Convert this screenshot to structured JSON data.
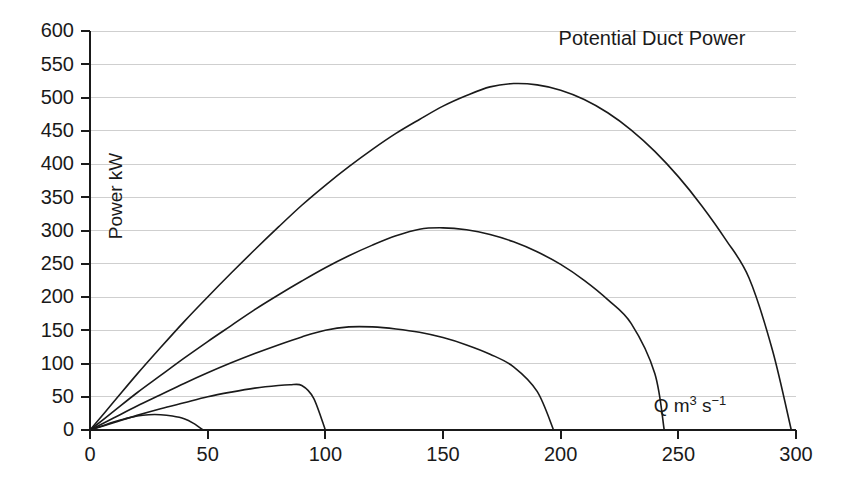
{
  "chart_data": {
    "type": "line",
    "title": "Potential Duct Power",
    "xlabel": "Q m3 s-1",
    "xlabel_parts": {
      "base1": "Q m",
      "sup1": "3",
      "base2": " s",
      "sup2": "−1"
    },
    "ylabel": "Power kW",
    "xlim": [
      0,
      300
    ],
    "ylim": [
      0,
      600
    ],
    "xticks": [
      0,
      50,
      100,
      150,
      200,
      250,
      300
    ],
    "yticks": [
      0,
      50,
      100,
      150,
      200,
      250,
      300,
      350,
      400,
      450,
      500,
      550,
      600
    ],
    "grid": "horizontal",
    "legend": "none",
    "line_color": "#1a1a1a",
    "grid_color": "#cfcfcf",
    "series": [
      {
        "name": "curve-1",
        "peak": {
          "x": 172,
          "y": 522
        },
        "x_end": 298,
        "x": [
          0,
          10,
          20,
          30,
          40,
          50,
          60,
          70,
          80,
          90,
          100,
          110,
          120,
          130,
          140,
          150,
          160,
          170,
          180,
          190,
          200,
          210,
          220,
          230,
          240,
          250,
          260,
          270,
          280,
          290,
          298
        ],
        "values": [
          0,
          42,
          84,
          124,
          163,
          200,
          236,
          271,
          305,
          338,
          368,
          396,
          422,
          446,
          467,
          487,
          503,
          516,
          521,
          519,
          511,
          497,
          477,
          451,
          419,
          381,
          337,
          287,
          229,
          120,
          0
        ]
      },
      {
        "name": "curve-2",
        "peak": {
          "x": 144,
          "y": 305
        },
        "x_end": 244,
        "x": [
          0,
          10,
          20,
          30,
          40,
          50,
          60,
          70,
          80,
          90,
          100,
          110,
          120,
          130,
          140,
          150,
          160,
          170,
          180,
          190,
          200,
          210,
          220,
          230,
          240,
          244
        ],
        "values": [
          0,
          28,
          56,
          82,
          108,
          133,
          157,
          181,
          203,
          224,
          244,
          262,
          278,
          292,
          302,
          304,
          301,
          294,
          283,
          268,
          249,
          225,
          196,
          160,
          85,
          0
        ]
      },
      {
        "name": "curve-3",
        "peak": {
          "x": 113,
          "y": 156
        },
        "x_end": 197,
        "x": [
          0,
          10,
          20,
          30,
          40,
          50,
          60,
          70,
          80,
          90,
          100,
          110,
          120,
          130,
          140,
          150,
          160,
          170,
          180,
          190,
          197
        ],
        "values": [
          0,
          18,
          36,
          53,
          70,
          86,
          101,
          115,
          128,
          140,
          150,
          155,
          155,
          152,
          147,
          139,
          128,
          114,
          95,
          58,
          0
        ]
      },
      {
        "name": "curve-4",
        "peak": {
          "x": 88,
          "y": 68
        },
        "x_end": 100,
        "x": [
          0,
          10,
          20,
          30,
          40,
          50,
          60,
          70,
          80,
          85,
          90,
          95,
          100
        ],
        "values": [
          0,
          11,
          22,
          32,
          41,
          50,
          57,
          63,
          67,
          68,
          67,
          48,
          0
        ]
      },
      {
        "name": "curve-5",
        "peak": {
          "x": 30,
          "y": 23
        },
        "x_end": 48,
        "x": [
          0,
          5,
          10,
          15,
          20,
          25,
          30,
          35,
          40,
          44,
          48
        ],
        "values": [
          0,
          6,
          12,
          17,
          21,
          23,
          23,
          21,
          17,
          10,
          0
        ]
      }
    ]
  }
}
